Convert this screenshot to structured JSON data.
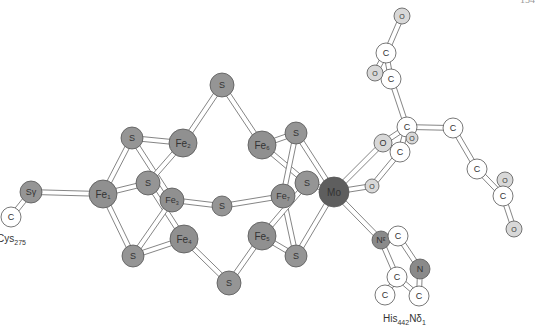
{
  "page_number": "154",
  "figure": {
    "colors": {
      "fe": "#909090",
      "s": "#959595",
      "mo": "#5e5e5e",
      "o": "#d8d8d8",
      "n": "#8a8a8a",
      "c": "#ffffff",
      "outline": "#555555",
      "bond": "#777777"
    },
    "labels": {
      "cys": {
        "main": "Cys",
        "sub": "275"
      },
      "his": {
        "main": "His",
        "sub": "442",
        "tail": "Nδ",
        "tail_sub": "1"
      }
    },
    "atoms": [
      {
        "id": "sg",
        "el": "S",
        "label": "Sγ",
        "sub": "",
        "x": 31,
        "y": 192,
        "r": 11,
        "type": "s"
      },
      {
        "id": "c_cys",
        "el": "C",
        "label": "C",
        "sub": "",
        "x": 11,
        "y": 217,
        "r": 10,
        "type": "c"
      },
      {
        "id": "fe1",
        "el": "Fe",
        "label": "Fe",
        "sub": "1",
        "x": 103,
        "y": 194,
        "r": 14,
        "type": "fe"
      },
      {
        "id": "s_tl",
        "el": "S",
        "label": "S",
        "sub": "",
        "x": 132,
        "y": 138,
        "r": 11,
        "type": "s"
      },
      {
        "id": "fe2",
        "el": "Fe",
        "label": "Fe",
        "sub": "2",
        "x": 183,
        "y": 143,
        "r": 14,
        "type": "fe"
      },
      {
        "id": "s_top",
        "el": "S",
        "label": "S",
        "sub": "",
        "x": 222,
        "y": 85,
        "r": 12,
        "type": "s"
      },
      {
        "id": "fe6",
        "el": "Fe",
        "label": "Fe",
        "sub": "6",
        "x": 262,
        "y": 145,
        "r": 14,
        "type": "fe"
      },
      {
        "id": "s_tr",
        "el": "S",
        "label": "S",
        "sub": "",
        "x": 296,
        "y": 133,
        "r": 11,
        "type": "s"
      },
      {
        "id": "s_cl",
        "el": "S",
        "label": "S",
        "sub": "",
        "x": 148,
        "y": 183,
        "r": 12,
        "type": "s"
      },
      {
        "id": "fe3",
        "el": "Fe",
        "label": "Fe",
        "sub": "3",
        "x": 172,
        "y": 200,
        "r": 12,
        "type": "fe"
      },
      {
        "id": "s_mid",
        "el": "S",
        "label": "S",
        "sub": "",
        "x": 222,
        "y": 206,
        "r": 10,
        "type": "s"
      },
      {
        "id": "fe7",
        "el": "Fe",
        "label": "Fe",
        "sub": "7",
        "x": 283,
        "y": 196,
        "r": 12,
        "type": "fe"
      },
      {
        "id": "s_cr",
        "el": "S",
        "label": "S",
        "sub": "",
        "x": 307,
        "y": 183,
        "r": 12,
        "type": "s"
      },
      {
        "id": "mo",
        "el": "Mo",
        "label": "Mo",
        "sub": "",
        "x": 334,
        "y": 192,
        "r": 15,
        "type": "mo"
      },
      {
        "id": "fe4",
        "el": "Fe",
        "label": "Fe",
        "sub": "4",
        "x": 184,
        "y": 239,
        "r": 14,
        "type": "fe"
      },
      {
        "id": "fe5",
        "el": "Fe",
        "label": "Fe",
        "sub": "5",
        "x": 262,
        "y": 236,
        "r": 14,
        "type": "fe"
      },
      {
        "id": "s_bl",
        "el": "S",
        "label": "S",
        "sub": "",
        "x": 133,
        "y": 256,
        "r": 11,
        "type": "s"
      },
      {
        "id": "s_bot",
        "el": "S",
        "label": "S",
        "sub": "",
        "x": 229,
        "y": 283,
        "r": 12,
        "type": "s"
      },
      {
        "id": "s_br",
        "el": "S",
        "label": "S",
        "sub": "",
        "x": 296,
        "y": 256,
        "r": 11,
        "type": "s"
      },
      {
        "id": "o1",
        "el": "O",
        "label": "O",
        "sub": "",
        "x": 383,
        "y": 143,
        "r": 9,
        "type": "o"
      },
      {
        "id": "o2",
        "el": "O",
        "label": "O",
        "sub": "",
        "x": 372,
        "y": 186,
        "r": 7,
        "type": "o"
      },
      {
        "id": "c_hc3",
        "el": "C",
        "label": "C",
        "sub": "",
        "x": 407,
        "y": 127,
        "r": 10,
        "type": "c"
      },
      {
        "id": "o_small",
        "el": "O",
        "label": "O",
        "sub": "",
        "x": 412,
        "y": 138,
        "r": 6,
        "type": "o"
      },
      {
        "id": "c_hc_b",
        "el": "C",
        "label": "C",
        "sub": "",
        "x": 400,
        "y": 152,
        "r": 10,
        "type": "c"
      },
      {
        "id": "c_hc2",
        "el": "C",
        "label": "C",
        "sub": "",
        "x": 391,
        "y": 79,
        "r": 10,
        "type": "c"
      },
      {
        "id": "c_hc1",
        "el": "C",
        "label": "C",
        "sub": "",
        "x": 386,
        "y": 53,
        "r": 10,
        "type": "c"
      },
      {
        "id": "o_top",
        "el": "O",
        "label": "O",
        "sub": "",
        "x": 402,
        "y": 16,
        "r": 8,
        "type": "o"
      },
      {
        "id": "o_left",
        "el": "O",
        "label": "O",
        "sub": "",
        "x": 375,
        "y": 73,
        "r": 8,
        "type": "o"
      },
      {
        "id": "c_r1",
        "el": "C",
        "label": "C",
        "sub": "",
        "x": 453,
        "y": 128,
        "r": 10,
        "type": "c"
      },
      {
        "id": "c_r2",
        "el": "C",
        "label": "C",
        "sub": "",
        "x": 477,
        "y": 169,
        "r": 10,
        "type": "c"
      },
      {
        "id": "o_r1",
        "el": "O",
        "label": "O",
        "sub": "",
        "x": 505,
        "y": 180,
        "r": 8,
        "type": "o"
      },
      {
        "id": "c_r3",
        "el": "C",
        "label": "C",
        "sub": "",
        "x": 503,
        "y": 196,
        "r": 10,
        "type": "c"
      },
      {
        "id": "o_r2",
        "el": "O",
        "label": "O",
        "sub": "",
        "x": 514,
        "y": 229,
        "r": 8,
        "type": "o"
      },
      {
        "id": "n_e",
        "el": "N",
        "label": "Nᵋ",
        "sub": "",
        "x": 381,
        "y": 240,
        "r": 9,
        "type": "n"
      },
      {
        "id": "c_h1",
        "el": "C",
        "label": "C",
        "sub": "",
        "x": 398,
        "y": 236,
        "r": 10,
        "type": "c"
      },
      {
        "id": "n_d",
        "el": "N",
        "label": "N",
        "sub": "",
        "x": 420,
        "y": 269,
        "r": 10,
        "type": "n"
      },
      {
        "id": "c_h2",
        "el": "C",
        "label": "C",
        "sub": "",
        "x": 397,
        "y": 277,
        "r": 10,
        "type": "c"
      },
      {
        "id": "c_h3",
        "el": "C",
        "label": "C",
        "sub": "",
        "x": 385,
        "y": 295,
        "r": 10,
        "type": "c"
      },
      {
        "id": "c_h4",
        "el": "C",
        "label": "C",
        "sub": "",
        "x": 419,
        "y": 296,
        "r": 10,
        "type": "c"
      }
    ],
    "bonds": [
      [
        "c_cys",
        "sg"
      ],
      [
        "sg",
        "fe1"
      ],
      [
        "fe1",
        "s_tl"
      ],
      [
        "fe1",
        "s_cl"
      ],
      [
        "fe1",
        "s_bl"
      ],
      [
        "s_tl",
        "fe2"
      ],
      [
        "s_tl",
        "fe3"
      ],
      [
        "fe2",
        "s_cl"
      ],
      [
        "fe2",
        "s_top"
      ],
      [
        "s_cl",
        "fe4"
      ],
      [
        "s_bl",
        "fe4"
      ],
      [
        "s_bl",
        "fe3"
      ],
      [
        "fe3",
        "s_mid"
      ],
      [
        "s_mid",
        "fe7"
      ],
      [
        "fe4",
        "s_bot"
      ],
      [
        "s_bot",
        "fe5"
      ],
      [
        "s_top",
        "fe6"
      ],
      [
        "fe6",
        "s_tr"
      ],
      [
        "fe6",
        "s_cr"
      ],
      [
        "s_tr",
        "fe7"
      ],
      [
        "fe7",
        "s_br"
      ],
      [
        "fe5",
        "s_br"
      ],
      [
        "fe5",
        "s_cr"
      ],
      [
        "s_tr",
        "mo"
      ],
      [
        "s_cr",
        "mo"
      ],
      [
        "s_br",
        "mo"
      ],
      [
        "mo",
        "o1"
      ],
      [
        "mo",
        "o2"
      ],
      [
        "mo",
        "n_e"
      ],
      [
        "o1",
        "c_hc3"
      ],
      [
        "o2",
        "c_hc_b"
      ],
      [
        "c_hc3",
        "c_hc_b"
      ],
      [
        "c_hc3",
        "c_r1"
      ],
      [
        "c_hc3",
        "c_hc2"
      ],
      [
        "c_hc2",
        "c_hc1"
      ],
      [
        "c_hc1",
        "o_top"
      ],
      [
        "c_hc1",
        "o_left"
      ],
      [
        "c_r1",
        "c_r2"
      ],
      [
        "c_r2",
        "c_r3"
      ],
      [
        "c_r3",
        "o_r1"
      ],
      [
        "c_r3",
        "o_r2"
      ],
      [
        "n_e",
        "c_h1"
      ],
      [
        "n_e",
        "c_h2"
      ],
      [
        "c_h1",
        "n_d"
      ],
      [
        "n_d",
        "c_h4"
      ],
      [
        "c_h2",
        "c_h4"
      ],
      [
        "c_h2",
        "c_h3"
      ]
    ]
  }
}
